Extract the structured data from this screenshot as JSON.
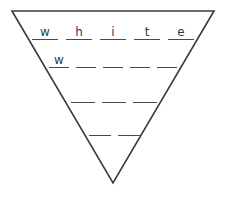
{
  "worksheet": {
    "type": "word-pyramid",
    "shape": "inverted-triangle",
    "title": "Word Pyramid",
    "colors": {
      "background": "#ffffff",
      "outline": "#3a3a3a",
      "blank_line": "#4a4a4a",
      "handwriting": "#3a3a3a"
    },
    "triangle": {
      "top_left": "12,11",
      "top_right": "214,11",
      "apex": "113,183"
    },
    "rows": [
      {
        "index": 1,
        "blank_count": 5,
        "word": "white",
        "letters": [
          "w",
          "h",
          "i",
          "t",
          "e"
        ]
      },
      {
        "index": 2,
        "blank_count": 5,
        "word": "w",
        "letters": [
          "w",
          "",
          "",
          "",
          ""
        ]
      },
      {
        "index": 3,
        "blank_count": 3,
        "word": "",
        "letters": [
          "",
          "",
          ""
        ]
      },
      {
        "index": 4,
        "blank_count": 2,
        "word": "",
        "letters": [
          "",
          ""
        ]
      }
    ]
  }
}
